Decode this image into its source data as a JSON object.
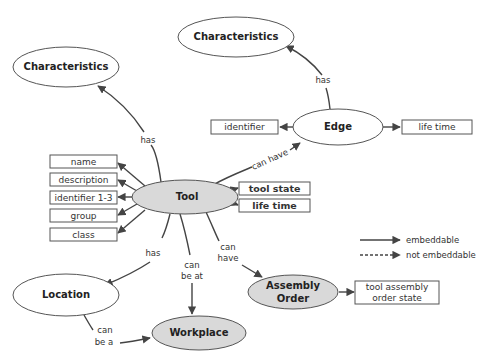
{
  "diagram": {
    "nodes": {
      "characteristics_left": "Characteristics",
      "characteristics_top": "Characteristics",
      "edge": "Edge",
      "tool": "Tool",
      "location": "Location",
      "workplace": "Workplace",
      "assembly_order_line1": "Assembly",
      "assembly_order_line2": "Order"
    },
    "attributes": {
      "edge_identifier": "identifier",
      "edge_life_time": "life time",
      "tool_name": "name",
      "tool_description": "description",
      "tool_identifier": "identifier 1-3",
      "tool_group": "group",
      "tool_class": "class",
      "tool_state": "tool state",
      "tool_life_time": "life time",
      "assembly_state_line1": "tool assembly",
      "assembly_state_line2": "order state"
    },
    "relations": {
      "tool_has_characteristics": "has",
      "edge_has_characteristics": "has",
      "tool_can_have_edge": "can have",
      "tool_has_location": "has",
      "tool_can_be_at_workplace_line1": "can",
      "tool_can_be_at_workplace_line2": "be at",
      "tool_can_have_assembly_line1": "can",
      "tool_can_have_assembly_line2": "have",
      "location_can_be_workplace_line1": "can",
      "location_can_be_workplace_line2": "be a"
    },
    "legend": {
      "solid": "embeddable",
      "dashed": "not embeddable"
    },
    "colors": {
      "stroke": "#555555",
      "arrow": "#444444",
      "filled_node": "#d9d9d9",
      "text": "#222222"
    }
  }
}
